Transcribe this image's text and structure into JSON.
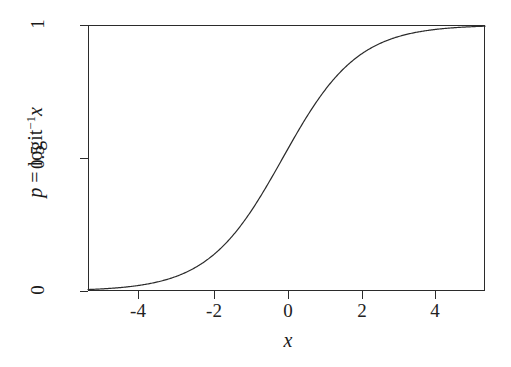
{
  "figure": {
    "background_color": "#ffffff",
    "line_color": "#2b2b2b",
    "frame_color": "#2b2b2b"
  },
  "axes": {
    "x_title": "x",
    "y_title_parts": {
      "p": "p",
      "equals": " = ",
      "logit": "logit",
      "exponent": "−1",
      "arg": "x"
    },
    "x_ticklabels": [
      "-4",
      "-2",
      "0",
      "2",
      "4"
    ],
    "y_ticklabels": [
      "0",
      "0.5",
      "1"
    ]
  },
  "chart_data": {
    "type": "line",
    "title": "",
    "subtitle": "",
    "xlabel": "x",
    "ylabel": "p = logit^-1 x",
    "xlim": [
      -5.2,
      5.4
    ],
    "ylim": [
      0,
      1
    ],
    "xticks": [
      -4,
      -2,
      0,
      2,
      4
    ],
    "yticks": [
      0,
      0.5,
      1
    ],
    "grid": false,
    "legend": "none",
    "annotations": [],
    "series": [
      {
        "name": "inverse logit",
        "formula": "p = 1 / (1 + exp(-x))",
        "x": [
          -5.2,
          -5.0,
          -4.8,
          -4.6,
          -4.4,
          -4.2,
          -4.0,
          -3.8,
          -3.6,
          -3.4,
          -3.2,
          -3.0,
          -2.8,
          -2.6,
          -2.4,
          -2.2,
          -2.0,
          -1.8,
          -1.6,
          -1.4,
          -1.2,
          -1.0,
          -0.8,
          -0.6,
          -0.4,
          -0.2,
          0.0,
          0.2,
          0.4,
          0.6,
          0.8,
          1.0,
          1.2,
          1.4,
          1.6,
          1.8,
          2.0,
          2.2,
          2.4,
          2.6,
          2.8,
          3.0,
          3.2,
          3.4,
          3.6,
          3.8,
          4.0,
          4.2,
          4.4,
          4.6,
          4.8,
          5.0,
          5.2,
          5.4
        ],
        "y": [
          0.0055,
          0.0067,
          0.0082,
          0.01,
          0.0121,
          0.0148,
          0.018,
          0.0219,
          0.0266,
          0.0323,
          0.0392,
          0.0474,
          0.0573,
          0.0691,
          0.0832,
          0.0998,
          0.1192,
          0.1419,
          0.168,
          0.1978,
          0.2315,
          0.2689,
          0.31,
          0.3543,
          0.4013,
          0.4502,
          0.5,
          0.5498,
          0.5987,
          0.6457,
          0.69,
          0.7311,
          0.7685,
          0.8022,
          0.832,
          0.8581,
          0.8808,
          0.9002,
          0.9168,
          0.9309,
          0.9427,
          0.9526,
          0.9608,
          0.9677,
          0.9734,
          0.9781,
          0.982,
          0.9852,
          0.9879,
          0.99,
          0.9918,
          0.9933,
          0.9945,
          0.9955
        ]
      }
    ]
  }
}
